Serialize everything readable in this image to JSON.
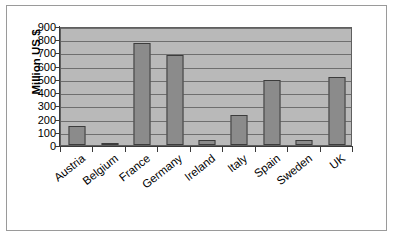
{
  "chart_data": {
    "type": "bar",
    "title": "",
    "subtitle": "",
    "xlabel": "",
    "ylabel": "Million US $",
    "ylim": [
      0,
      900
    ],
    "ytick_step": 100,
    "yticks": [
      900,
      800,
      700,
      600,
      500,
      400,
      300,
      200,
      100,
      0
    ],
    "grid": true,
    "legend": "none",
    "categories": [
      "Austria",
      "Belgium",
      "France",
      "Germany",
      "Ireland",
      "Italy",
      "Spain",
      "Sweden",
      "UK"
    ],
    "values": [
      145,
      15,
      775,
      680,
      40,
      230,
      490,
      40,
      515
    ],
    "series": [
      {
        "name": "Million US $",
        "values": [
          145,
          15,
          775,
          680,
          40,
          230,
          490,
          40,
          515
        ]
      }
    ]
  },
  "style": {
    "bar_fill": "#8b8b8b",
    "bar_border": "#3c3c3c",
    "plot_background": "#b9b9b9",
    "gridline_color": "#6e6e6e",
    "axis_color": "#3a3a3a",
    "frame_color": "#9a9a9a",
    "page_background": "#ffffff",
    "text_color": "#000000"
  }
}
